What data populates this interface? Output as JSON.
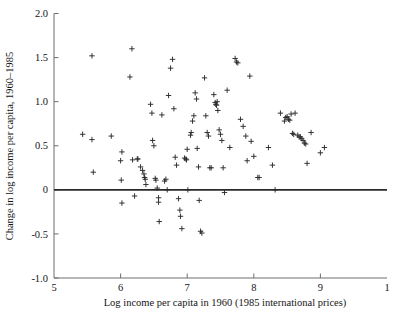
{
  "chart_data": {
    "type": "scatter",
    "title": "",
    "xlabel": "Log income per capita in 1960 (1985 international prices)",
    "ylabel": "Change in log income per capita, 1960–1985",
    "xlim": [
      5,
      10
    ],
    "ylim": [
      -1.0,
      2.0
    ],
    "xticks": [
      5,
      6,
      7,
      8,
      9,
      10
    ],
    "xticklabels": [
      "5",
      "6",
      "7",
      "8",
      "9",
      "1"
    ],
    "yticks": [
      -1.0,
      -0.5,
      0,
      0.5,
      1.0,
      1.5,
      2.0
    ],
    "yticklabels": [
      "-1.0",
      "-0.5",
      "0",
      "0.5",
      "1.0",
      "1.5",
      "2.0"
    ],
    "grid": false,
    "legend": null,
    "marker": "plus",
    "marker_color": "#2b2b2b",
    "reference_lines": [
      {
        "name": "zero-line",
        "orientation": "horizontal",
        "y": 0,
        "color": "#2a2a2a",
        "width": 1.9
      }
    ],
    "points": [
      [
        5.43,
        0.63
      ],
      [
        5.57,
        0.57
      ],
      [
        5.57,
        1.52
      ],
      [
        5.59,
        0.2
      ],
      [
        5.86,
        0.61
      ],
      [
        6.02,
        0.43
      ],
      [
        6.0,
        0.33
      ],
      [
        6.01,
        0.11
      ],
      [
        6.02,
        -0.15
      ],
      [
        6.14,
        1.28
      ],
      [
        6.17,
        1.6
      ],
      [
        6.18,
        0.34
      ],
      [
        6.21,
        -0.07
      ],
      [
        6.25,
        0.35
      ],
      [
        6.26,
        0.35
      ],
      [
        6.3,
        0.26
      ],
      [
        6.33,
        0.22
      ],
      [
        6.35,
        0.18
      ],
      [
        6.36,
        0.14
      ],
      [
        6.37,
        0.12
      ],
      [
        6.38,
        0.06
      ],
      [
        6.45,
        0.97
      ],
      [
        6.47,
        0.87
      ],
      [
        6.48,
        0.56
      ],
      [
        6.5,
        0.5
      ],
      [
        6.52,
        0.13
      ],
      [
        6.53,
        0.11
      ],
      [
        6.55,
        0.02
      ],
      [
        6.57,
        -0.09
      ],
      [
        6.57,
        -0.14
      ],
      [
        6.58,
        -0.36
      ],
      [
        6.62,
        0.85
      ],
      [
        6.66,
        0.1
      ],
      [
        6.68,
        0.12
      ],
      [
        6.7,
        0.0
      ],
      [
        6.72,
        1.07
      ],
      [
        6.75,
        1.38
      ],
      [
        6.78,
        1.48
      ],
      [
        6.8,
        0.92
      ],
      [
        6.82,
        0.37
      ],
      [
        6.84,
        0.28
      ],
      [
        6.87,
        -0.1
      ],
      [
        6.89,
        -0.23
      ],
      [
        6.9,
        -0.3
      ],
      [
        6.92,
        -0.44
      ],
      [
        6.96,
        0.36
      ],
      [
        6.98,
        0.35
      ],
      [
        6.99,
        0.34
      ],
      [
        7.0,
        0.46
      ],
      [
        7.01,
        0.0
      ],
      [
        7.05,
        0.62
      ],
      [
        7.06,
        0.65
      ],
      [
        7.08,
        0.78
      ],
      [
        7.1,
        0.84
      ],
      [
        7.12,
        1.1
      ],
      [
        7.14,
        1.03
      ],
      [
        7.15,
        0.47
      ],
      [
        7.17,
        0.26
      ],
      [
        7.18,
        -0.12
      ],
      [
        7.2,
        -0.47
      ],
      [
        7.22,
        -0.49
      ],
      [
        7.26,
        1.27
      ],
      [
        7.28,
        0.84
      ],
      [
        7.3,
        0.65
      ],
      [
        7.32,
        0.61
      ],
      [
        7.34,
        0.25
      ],
      [
        7.36,
        0.25
      ],
      [
        7.4,
        1.08
      ],
      [
        7.42,
        0.99
      ],
      [
        7.43,
        0.97
      ],
      [
        7.44,
        0.96
      ],
      [
        7.45,
        1.0
      ],
      [
        7.46,
        0.9
      ],
      [
        7.48,
        0.68
      ],
      [
        7.5,
        0.63
      ],
      [
        7.52,
        0.56
      ],
      [
        7.54,
        0.25
      ],
      [
        7.56,
        -0.03
      ],
      [
        7.6,
        1.13
      ],
      [
        7.64,
        0.48
      ],
      [
        7.72,
        1.49
      ],
      [
        7.74,
        1.45
      ],
      [
        7.76,
        1.44
      ],
      [
        7.8,
        0.8
      ],
      [
        7.84,
        0.72
      ],
      [
        7.88,
        0.61
      ],
      [
        7.9,
        0.33
      ],
      [
        7.94,
        1.29
      ],
      [
        7.96,
        0.55
      ],
      [
        8.0,
        0.38
      ],
      [
        8.06,
        0.14
      ],
      [
        8.08,
        0.14
      ],
      [
        8.22,
        0.48
      ],
      [
        8.28,
        0.28
      ],
      [
        8.32,
        0.0
      ],
      [
        8.4,
        0.87
      ],
      [
        8.46,
        0.78
      ],
      [
        8.48,
        0.82
      ],
      [
        8.5,
        0.83
      ],
      [
        8.52,
        0.8
      ],
      [
        8.54,
        0.79
      ],
      [
        8.56,
        0.86
      ],
      [
        8.58,
        0.64
      ],
      [
        8.6,
        0.63
      ],
      [
        8.62,
        0.87
      ],
      [
        8.66,
        0.62
      ],
      [
        8.68,
        0.6
      ],
      [
        8.7,
        0.6
      ],
      [
        8.72,
        0.58
      ],
      [
        8.74,
        0.56
      ],
      [
        8.76,
        0.53
      ],
      [
        8.78,
        0.52
      ],
      [
        8.8,
        0.3
      ],
      [
        8.86,
        0.65
      ],
      [
        9.0,
        0.42
      ],
      [
        9.06,
        0.48
      ]
    ],
    "point_count": 118
  },
  "figure": {
    "background": "#ffffff",
    "frame_color": "#6e6e6e"
  }
}
